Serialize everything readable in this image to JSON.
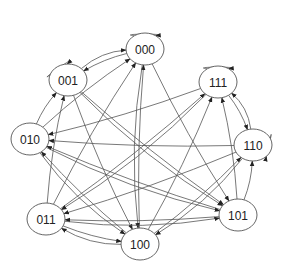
{
  "diagram": {
    "type": "state-transition-graph",
    "colors": {
      "stroke": "#555555",
      "fill": "#ffffff",
      "text": "#222222"
    },
    "nodes": [
      {
        "id": "000",
        "label": "000",
        "x": 145,
        "y": 49
      },
      {
        "id": "001",
        "label": "001",
        "x": 68,
        "y": 80
      },
      {
        "id": "111",
        "label": "111",
        "x": 218,
        "y": 82
      },
      {
        "id": "010",
        "label": "010",
        "x": 30,
        "y": 139
      },
      {
        "id": "110",
        "label": "110",
        "x": 253,
        "y": 145
      },
      {
        "id": "011",
        "label": "011",
        "x": 46,
        "y": 219
      },
      {
        "id": "101",
        "label": "101",
        "x": 238,
        "y": 215
      },
      {
        "id": "100",
        "label": "100",
        "x": 140,
        "y": 244
      }
    ],
    "self_loops": [
      "000",
      "001",
      "111",
      "110"
    ],
    "edges": [
      {
        "from": "000",
        "to": "001"
      },
      {
        "from": "001",
        "to": "000"
      },
      {
        "from": "010",
        "to": "000"
      },
      {
        "from": "011",
        "to": "000"
      },
      {
        "from": "100",
        "to": "000"
      },
      {
        "from": "000",
        "to": "100"
      },
      {
        "from": "000",
        "to": "101"
      },
      {
        "from": "010",
        "to": "001"
      },
      {
        "from": "011",
        "to": "001"
      },
      {
        "from": "001",
        "to": "100"
      },
      {
        "from": "001",
        "to": "101"
      },
      {
        "from": "111",
        "to": "010"
      },
      {
        "from": "110",
        "to": "010"
      },
      {
        "from": "101",
        "to": "010"
      },
      {
        "from": "100",
        "to": "010"
      },
      {
        "from": "010",
        "to": "101"
      },
      {
        "from": "010",
        "to": "100"
      },
      {
        "from": "111",
        "to": "110"
      },
      {
        "from": "110",
        "to": "111"
      },
      {
        "from": "101",
        "to": "111"
      },
      {
        "from": "100",
        "to": "111"
      },
      {
        "from": "011",
        "to": "111"
      },
      {
        "from": "111",
        "to": "011"
      },
      {
        "from": "110",
        "to": "011"
      },
      {
        "from": "101",
        "to": "011"
      },
      {
        "from": "011",
        "to": "101"
      },
      {
        "from": "011",
        "to": "100"
      },
      {
        "from": "100",
        "to": "011"
      },
      {
        "from": "101",
        "to": "110"
      },
      {
        "from": "100",
        "to": "110"
      },
      {
        "from": "110",
        "to": "100"
      },
      {
        "from": "001",
        "to": "101"
      }
    ]
  }
}
